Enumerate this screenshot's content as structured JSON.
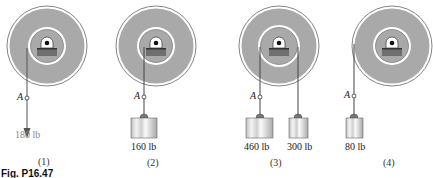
{
  "figure": {
    "caption": "Fig. P16.47",
    "colors": {
      "disk_fill": "#a8a8a8",
      "ring_white": "#ffffff",
      "outline": "#555555",
      "bearing_block": "#7a7a7a",
      "weight_fill": "#e6e6e6"
    },
    "panels": [
      {
        "id": "1",
        "label": "(1)",
        "point": "A",
        "load": "180 lb",
        "load_type": "force-arrow"
      },
      {
        "id": "2",
        "label": "(2)",
        "point": "A",
        "load": "160 lb",
        "load_type": "weight"
      },
      {
        "id": "3",
        "label": "(3)",
        "point": "A",
        "loads": [
          "460 lb",
          "300 lb"
        ],
        "load_type": "two-weights"
      },
      {
        "id": "4",
        "label": "(4)",
        "point": "A",
        "load": "80 lb",
        "load_type": "weight"
      }
    ]
  }
}
